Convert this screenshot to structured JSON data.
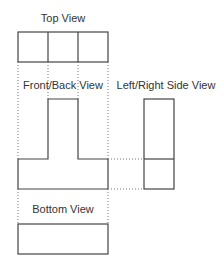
{
  "diagram": {
    "type": "orthographic-projection",
    "labels": {
      "top": "Top View",
      "front": "Front/Back View",
      "side": "Left/Right Side View",
      "bottom": "Bottom View"
    },
    "colors": {
      "line": "#444444",
      "projection_line": "#777777",
      "text": "#333333",
      "background": "#ffffff"
    }
  }
}
